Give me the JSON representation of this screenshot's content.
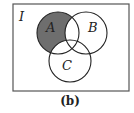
{
  "diagram": {
    "type": "venn",
    "universe_label": "I",
    "sets": [
      {
        "label": "A",
        "cx": 58,
        "cy": 33,
        "r": 21
      },
      {
        "label": "B",
        "cx": 86,
        "cy": 33,
        "r": 21
      },
      {
        "label": "C",
        "cx": 70,
        "cy": 61,
        "r": 21
      }
    ],
    "shaded_region": "A only (A minus B minus C)",
    "caption": "(b)",
    "colors": {
      "shade": "#6e6e6e",
      "stroke": "#222222",
      "frame": "#555555",
      "background": "#ffffff"
    }
  }
}
